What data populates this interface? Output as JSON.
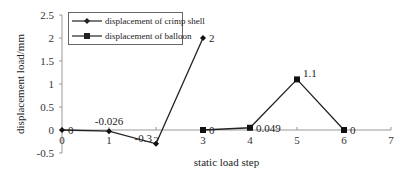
{
  "chart_data": {
    "type": "line",
    "title": "",
    "xlabel": "static load step",
    "ylabel": "displacement load/mm",
    "xlim": [
      0,
      7
    ],
    "ylim": [
      -0.5,
      2.5
    ],
    "x_ticks": [
      "0",
      "1",
      "2",
      "3",
      "4",
      "5",
      "6",
      "7"
    ],
    "y_ticks": [
      "2.5",
      "2",
      "1.5",
      "1",
      "0.5",
      "0",
      "-0.5"
    ],
    "grid": false,
    "legend_position": "top-left",
    "series": [
      {
        "name": "displacement of crimp shell",
        "marker": "diamond",
        "x": [
          0,
          1,
          2,
          3
        ],
        "values": [
          0,
          -0.026,
          -0.3,
          2
        ],
        "labels": [
          "0",
          "-0.026",
          "-0.3",
          "2"
        ]
      },
      {
        "name": "displacement of balloon",
        "marker": "square",
        "x": [
          3,
          4,
          5,
          6
        ],
        "values": [
          0,
          0.049,
          1.1,
          0
        ],
        "labels": [
          "0",
          "0.049",
          "1.1",
          "0"
        ]
      }
    ]
  },
  "legend": {
    "items": [
      "displacement of crimp shell",
      "displacement of balloon"
    ]
  }
}
